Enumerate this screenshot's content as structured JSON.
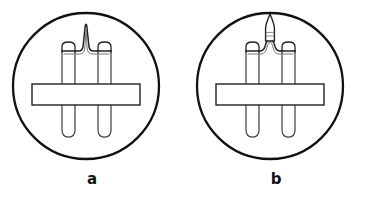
{
  "figure": {
    "type": "line-drawing",
    "background_color": "#ffffff",
    "stroke_color": "#111111",
    "inner_stroke_color": "#555555",
    "fill_color": "#ffffff",
    "width": 368,
    "height": 200,
    "panels": [
      {
        "id": "a",
        "label": "a",
        "circle": {
          "cx": 86,
          "cy": 86,
          "r": 74,
          "stroke_width": 2.2
        },
        "description": "Electrode assembly with narrow pointed filament peak",
        "filament_shape": "narrow-pointed-peak",
        "parts": [
          "left-post",
          "right-post",
          "left-post-cap",
          "right-post-cap",
          "horizontal-insulator-bar",
          "filament-arch"
        ]
      },
      {
        "id": "b",
        "label": "b",
        "circle": {
          "cx": 86,
          "cy": 86,
          "r": 74,
          "stroke_width": 2.2
        },
        "description": "Electrode assembly with broad arch topped by elongated needle spike",
        "filament_shape": "broad-arch-with-needle-spike",
        "parts": [
          "left-post",
          "right-post",
          "left-post-cap",
          "right-post-cap",
          "horizontal-insulator-bar",
          "filament-arch",
          "needle-spike"
        ]
      }
    ]
  }
}
